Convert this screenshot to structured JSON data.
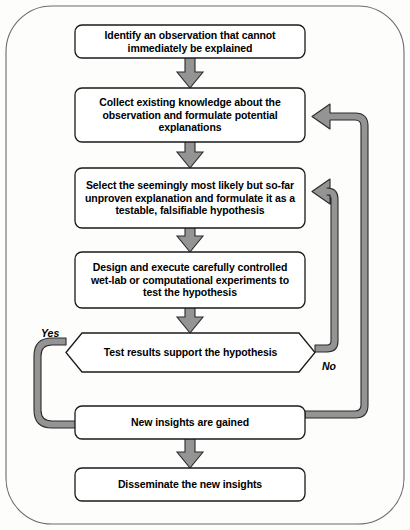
{
  "diagram": {
    "colors": {
      "node_fill": "#ffffff",
      "node_stroke": "#1a1a1a",
      "arrow_fill": "#949494",
      "arrow_stroke": "#2b2b2b",
      "frame_stroke": "#6b6b6b",
      "background": "#fdfdfc",
      "text": "#000000"
    },
    "nodes": [
      {
        "id": "observation",
        "shape": "rounded-rect",
        "text": "Identify an observation that cannot immediately be explained"
      },
      {
        "id": "collect-knowledge",
        "shape": "rounded-rect",
        "text": "Collect existing knowledge about the observation and formulate potential explanations"
      },
      {
        "id": "hypothesis",
        "shape": "rounded-rect",
        "text": "Select the seemingly most likely but so-far unproven explanation and formulate it as a testable, falsifiable hypothesis"
      },
      {
        "id": "experiments",
        "shape": "rounded-rect",
        "text": "Design and execute carefully controlled wet-lab or computational experiments to test the hypothesis"
      },
      {
        "id": "decision",
        "shape": "hexagon",
        "text": "Test results support the hypothesis"
      },
      {
        "id": "insights",
        "shape": "rounded-rect",
        "text": "New insights are gained"
      },
      {
        "id": "disseminate",
        "shape": "rounded-rect",
        "text": "Disseminate the new insights"
      }
    ],
    "branch_labels": [
      {
        "id": "yes",
        "text": "Yes"
      },
      {
        "id": "no",
        "text": "No"
      }
    ]
  }
}
